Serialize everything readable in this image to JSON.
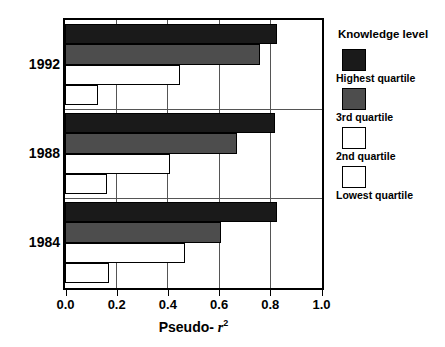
{
  "chart_data": {
    "type": "bar",
    "orientation": "horizontal",
    "title": "",
    "xlabel": "Pseudo- r 2",
    "xlabel_parts": {
      "prefix": "Pseudo- ",
      "symbol": "r",
      "exponent": "2"
    },
    "ylabel": "",
    "xlim": [
      0.0,
      1.0
    ],
    "xticks": [
      0.0,
      0.2,
      0.4,
      0.6,
      0.8,
      1.0
    ],
    "xticklabels": [
      "0.0",
      "0.2",
      "0.4",
      "0.6",
      "0.8",
      "1.0"
    ],
    "categories": [
      "1992",
      "1988",
      "1984"
    ],
    "grid": "vertical",
    "legend_position": "right",
    "series": [
      {
        "name": "Highest quartile",
        "color": "#1a1a1a",
        "style": "filled-black",
        "values": [
          0.83,
          0.82,
          0.83
        ]
      },
      {
        "name": "3rd quartile",
        "color": "#4d4d4d",
        "style": "filled-gray",
        "values": [
          0.76,
          0.67,
          0.61
        ]
      },
      {
        "name": "2nd quartile",
        "color": "#ffffff",
        "style": "outline",
        "values": [
          0.45,
          0.41,
          0.47
        ]
      },
      {
        "name": "Lowest quartile",
        "color": "#ffffff",
        "style": "outline",
        "values": [
          0.13,
          0.165,
          0.17
        ]
      }
    ]
  },
  "legend": {
    "title": "Knowledge level",
    "entries": [
      {
        "label": "Highest quartile",
        "swatch": "black"
      },
      {
        "label": "3rd quartile",
        "swatch": "gray"
      },
      {
        "label": "2nd quartile",
        "swatch": "white"
      },
      {
        "label": "Lowest quartile",
        "swatch": "white"
      }
    ]
  },
  "axis": {
    "x_tick_labels": [
      "0.0",
      "0.2",
      "0.4",
      "0.6",
      "0.8",
      "1.0"
    ],
    "x_title_prefix": "Pseudo- ",
    "x_title_symbol": "r",
    "x_title_exponent": "2",
    "y_group_labels": [
      "1992",
      "1988",
      "1984"
    ]
  }
}
